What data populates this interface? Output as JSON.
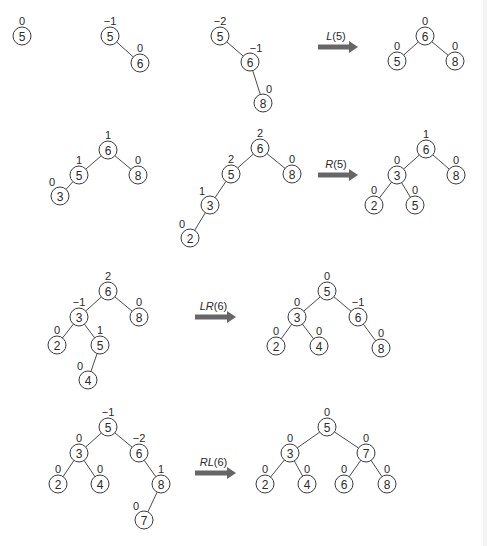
{
  "diagram": {
    "colors": {
      "node_stroke": "#3a3a3a",
      "edge": "#4a4a4a",
      "arrow": "#666666",
      "text": "#2a2a2a",
      "background": "#ffffff"
    },
    "node_radius": 9,
    "trees": [
      {
        "id": "r1-t1",
        "nodes": [
          {
            "key": "5",
            "bf": "0",
            "x": 22,
            "y": 36,
            "bf_side": "top"
          }
        ],
        "edges": []
      },
      {
        "id": "r1-t2",
        "nodes": [
          {
            "key": "5",
            "bf": "−1",
            "x": 110,
            "y": 36,
            "bf_side": "top"
          },
          {
            "key": "6",
            "bf": "0",
            "x": 140,
            "y": 63,
            "bf_side": "top"
          }
        ],
        "edges": [
          [
            0,
            1
          ]
        ]
      },
      {
        "id": "r1-t3",
        "nodes": [
          {
            "key": "5",
            "bf": "−2",
            "x": 220,
            "y": 36,
            "bf_side": "top"
          },
          {
            "key": "6",
            "bf": "−1",
            "x": 250,
            "y": 62,
            "bf_side": "topright"
          },
          {
            "key": "8",
            "bf": "0",
            "x": 263,
            "y": 103,
            "bf_side": "topright"
          }
        ],
        "edges": [
          [
            0,
            1
          ],
          [
            1,
            2
          ]
        ]
      },
      {
        "id": "r1-t4",
        "nodes": [
          {
            "key": "6",
            "bf": "0",
            "x": 425,
            "y": 36,
            "bf_side": "top"
          },
          {
            "key": "5",
            "bf": "0",
            "x": 397,
            "y": 61,
            "bf_side": "top"
          },
          {
            "key": "8",
            "bf": "0",
            "x": 455,
            "y": 61,
            "bf_side": "top"
          }
        ],
        "edges": [
          [
            0,
            1
          ],
          [
            0,
            2
          ]
        ]
      },
      {
        "id": "r2-t1",
        "nodes": [
          {
            "key": "6",
            "bf": "1",
            "x": 108,
            "y": 150,
            "bf_side": "top"
          },
          {
            "key": "5",
            "bf": "1",
            "x": 79,
            "y": 175,
            "bf_side": "top"
          },
          {
            "key": "8",
            "bf": "0",
            "x": 138,
            "y": 175,
            "bf_side": "top"
          },
          {
            "key": "3",
            "bf": "0",
            "x": 60,
            "y": 196,
            "bf_side": "topleft"
          }
        ],
        "edges": [
          [
            0,
            1
          ],
          [
            0,
            2
          ],
          [
            1,
            3
          ]
        ]
      },
      {
        "id": "r2-t2",
        "nodes": [
          {
            "key": "6",
            "bf": "2",
            "x": 260,
            "y": 148,
            "bf_side": "top"
          },
          {
            "key": "5",
            "bf": "2",
            "x": 231,
            "y": 174,
            "bf_side": "top"
          },
          {
            "key": "8",
            "bf": "0",
            "x": 292,
            "y": 174,
            "bf_side": "top"
          },
          {
            "key": "3",
            "bf": "1",
            "x": 210,
            "y": 205,
            "bf_side": "topleft"
          },
          {
            "key": "2",
            "bf": "0",
            "x": 190,
            "y": 238,
            "bf_side": "topleft"
          }
        ],
        "edges": [
          [
            0,
            1
          ],
          [
            0,
            2
          ],
          [
            1,
            3
          ],
          [
            3,
            4
          ]
        ]
      },
      {
        "id": "r2-t3",
        "nodes": [
          {
            "key": "6",
            "bf": "1",
            "x": 426,
            "y": 149,
            "bf_side": "top"
          },
          {
            "key": "3",
            "bf": "0",
            "x": 397,
            "y": 175,
            "bf_side": "top"
          },
          {
            "key": "8",
            "bf": "0",
            "x": 456,
            "y": 175,
            "bf_side": "top"
          },
          {
            "key": "2",
            "bf": "0",
            "x": 374,
            "y": 205,
            "bf_side": "top"
          },
          {
            "key": "5",
            "bf": "0",
            "x": 415,
            "y": 205,
            "bf_side": "top"
          }
        ],
        "edges": [
          [
            0,
            1
          ],
          [
            0,
            2
          ],
          [
            1,
            3
          ],
          [
            1,
            4
          ]
        ]
      },
      {
        "id": "r3-t1",
        "nodes": [
          {
            "key": "6",
            "bf": "2",
            "x": 108,
            "y": 291,
            "bf_side": "top"
          },
          {
            "key": "3",
            "bf": "−1",
            "x": 79,
            "y": 317,
            "bf_side": "top"
          },
          {
            "key": "8",
            "bf": "0",
            "x": 139,
            "y": 317,
            "bf_side": "top"
          },
          {
            "key": "2",
            "bf": "0",
            "x": 57,
            "y": 345,
            "bf_side": "top"
          },
          {
            "key": "5",
            "bf": "1",
            "x": 100,
            "y": 345,
            "bf_side": "top"
          },
          {
            "key": "4",
            "bf": "0",
            "x": 88,
            "y": 380,
            "bf_side": "topleft"
          }
        ],
        "edges": [
          [
            0,
            1
          ],
          [
            0,
            2
          ],
          [
            1,
            3
          ],
          [
            1,
            4
          ],
          [
            4,
            5
          ]
        ]
      },
      {
        "id": "r3-t2",
        "nodes": [
          {
            "key": "5",
            "bf": "0",
            "x": 327,
            "y": 291,
            "bf_side": "top"
          },
          {
            "key": "3",
            "bf": "0",
            "x": 297,
            "y": 317,
            "bf_side": "top"
          },
          {
            "key": "6",
            "bf": "−1",
            "x": 358,
            "y": 317,
            "bf_side": "top"
          },
          {
            "key": "2",
            "bf": "0",
            "x": 276,
            "y": 346,
            "bf_side": "top"
          },
          {
            "key": "4",
            "bf": "0",
            "x": 319,
            "y": 346,
            "bf_side": "top"
          },
          {
            "key": "8",
            "bf": "0",
            "x": 381,
            "y": 348,
            "bf_side": "top"
          }
        ],
        "edges": [
          [
            0,
            1
          ],
          [
            0,
            2
          ],
          [
            1,
            3
          ],
          [
            1,
            4
          ],
          [
            2,
            5
          ]
        ]
      },
      {
        "id": "r4-t1",
        "nodes": [
          {
            "key": "5",
            "bf": "−1",
            "x": 108,
            "y": 427,
            "bf_side": "top"
          },
          {
            "key": "3",
            "bf": "0",
            "x": 79,
            "y": 453,
            "bf_side": "top"
          },
          {
            "key": "6",
            "bf": "−2",
            "x": 139,
            "y": 453,
            "bf_side": "top"
          },
          {
            "key": "2",
            "bf": "0",
            "x": 58,
            "y": 484,
            "bf_side": "top"
          },
          {
            "key": "4",
            "bf": "0",
            "x": 100,
            "y": 484,
            "bf_side": "top"
          },
          {
            "key": "8",
            "bf": "1",
            "x": 161,
            "y": 484,
            "bf_side": "top"
          },
          {
            "key": "7",
            "bf": "0",
            "x": 144,
            "y": 520,
            "bf_side": "topleft"
          }
        ],
        "edges": [
          [
            0,
            1
          ],
          [
            0,
            2
          ],
          [
            1,
            3
          ],
          [
            1,
            4
          ],
          [
            2,
            5
          ],
          [
            5,
            6
          ]
        ]
      },
      {
        "id": "r4-t2",
        "nodes": [
          {
            "key": "5",
            "bf": "0",
            "x": 327,
            "y": 427,
            "bf_side": "top"
          },
          {
            "key": "3",
            "bf": "0",
            "x": 290,
            "y": 453,
            "bf_side": "top"
          },
          {
            "key": "7",
            "bf": "0",
            "x": 366,
            "y": 453,
            "bf_side": "top"
          },
          {
            "key": "2",
            "bf": "0",
            "x": 265,
            "y": 484,
            "bf_side": "top"
          },
          {
            "key": "4",
            "bf": "0",
            "x": 307,
            "y": 484,
            "bf_side": "top"
          },
          {
            "key": "6",
            "bf": "0",
            "x": 344,
            "y": 484,
            "bf_side": "top"
          },
          {
            "key": "8",
            "bf": "0",
            "x": 387,
            "y": 484,
            "bf_side": "top"
          }
        ],
        "edges": [
          [
            0,
            1
          ],
          [
            0,
            2
          ],
          [
            1,
            3
          ],
          [
            1,
            4
          ],
          [
            2,
            5
          ],
          [
            2,
            6
          ]
        ]
      }
    ],
    "arrows": [
      {
        "id": "arrow-l5",
        "rotation": "L",
        "arg": "(5)",
        "x1": 318,
        "x2": 358,
        "y": 47
      },
      {
        "id": "arrow-r5",
        "rotation": "R",
        "arg": "(5)",
        "x1": 318,
        "x2": 358,
        "y": 175
      },
      {
        "id": "arrow-lr6",
        "rotation": "LR",
        "arg": "(6)",
        "x1": 195,
        "x2": 236,
        "y": 317
      },
      {
        "id": "arrow-rl6",
        "rotation": "RL",
        "arg": "(6)",
        "x1": 195,
        "x2": 236,
        "y": 473
      }
    ]
  }
}
